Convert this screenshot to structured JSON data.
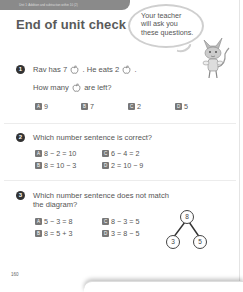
{
  "header": {
    "unit_label": "Unit 1: Addition and subtraction within 10 (2)",
    "title": "End of unit check"
  },
  "speech_bubble": {
    "lines": [
      "Your teacher",
      "will ask you",
      "these questions."
    ]
  },
  "questions": [
    {
      "number": "1",
      "line1_a": "Rav has 7",
      "line1_b": ". He eats 2",
      "line1_c": ".",
      "line2_a": "How many",
      "line2_b": "are left?",
      "icon": "apple-icon",
      "options": [
        {
          "letter": "A",
          "text": "9"
        },
        {
          "letter": "B",
          "text": "7"
        },
        {
          "letter": "C",
          "text": "2"
        },
        {
          "letter": "D",
          "text": "5"
        }
      ]
    },
    {
      "number": "2",
      "text": "Which number sentence is correct?",
      "options": [
        {
          "letter": "A",
          "text": "8 − 2 = 10"
        },
        {
          "letter": "B",
          "text": "8 = 10 − 3"
        },
        {
          "letter": "C",
          "text": "6 − 4 = 2"
        },
        {
          "letter": "D",
          "text": "2 = 10 − 9"
        }
      ]
    },
    {
      "number": "3",
      "line1": "Which number sentence does not match",
      "line2": "the diagram?",
      "options": [
        {
          "letter": "A",
          "text": "5 − 3 = 8"
        },
        {
          "letter": "B",
          "text": "8 = 5 + 3"
        },
        {
          "letter": "C",
          "text": "8 − 3 = 5"
        },
        {
          "letter": "D",
          "text": "3 = 8 − 5"
        }
      ],
      "diagram": {
        "whole": "8",
        "part1": "3",
        "part2": "5"
      }
    }
  ],
  "footer": {
    "page_number": "160"
  },
  "colors": {
    "badge": "#777777",
    "question_number": "#333333",
    "title": "#5a5a5a"
  }
}
